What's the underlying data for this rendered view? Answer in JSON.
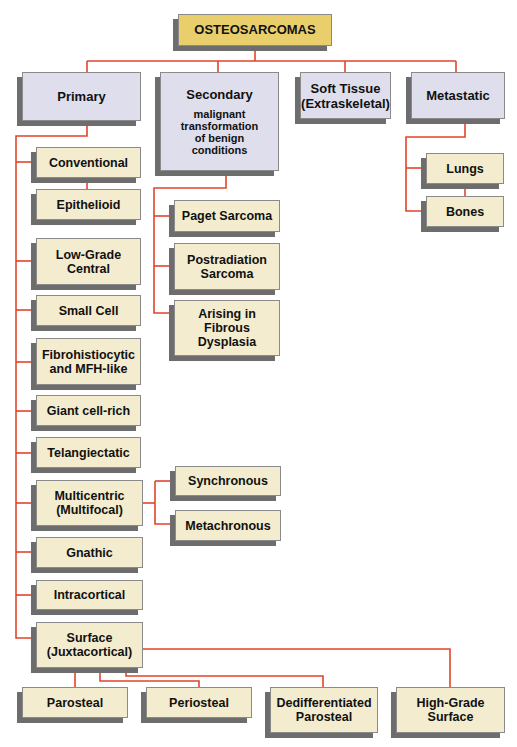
{
  "diagram": {
    "type": "tree",
    "colors": {
      "root_fill": "#e9cf6c",
      "category_fill": "#dedeec",
      "subtype_fill": "#f3ecce",
      "connector": "#e0452a",
      "shadow": "#6d6d6d"
    },
    "root": {
      "label": "OSTEOSARCOMAS"
    },
    "categories": {
      "primary": {
        "label": "Primary"
      },
      "secondary": {
        "label": "Secondary",
        "note": "malignant transformation of benign conditions"
      },
      "soft_tissue": {
        "label": "Soft Tissue (Extraskeletal)"
      },
      "metastatic": {
        "label": "Metastatic"
      }
    },
    "primary_subtypes": {
      "conventional": "Conventional",
      "epithelioid": "Epithelioid",
      "low_grade_central": "Low-Grade Central",
      "small_cell": "Small Cell",
      "fibrohistiocytic": "Fibrohistiocytic and MFH-like",
      "giant_cell_rich": "Giant cell-rich",
      "telangiectatic": "Telangiectatic",
      "multicentric": "Multicentric (Multifocal)",
      "gnathic": "Gnathic",
      "intracortical": "Intracortical",
      "surface": "Surface (Juxtacortical)"
    },
    "multicentric_subtypes": {
      "synchronous": "Synchronous",
      "metachronous": "Metachronous"
    },
    "surface_subtypes": {
      "parosteal": "Parosteal",
      "periosteal": "Periosteal",
      "dedifferentiated_parosteal": "Dedifferentiated Parosteal",
      "high_grade_surface": "High-Grade Surface"
    },
    "secondary_subtypes": {
      "paget_sarcoma": "Paget Sarcoma",
      "postradiation_sarcoma": "Postradiation Sarcoma",
      "arising_in_fibrous_dysplasia": "Arising in Fibrous Dysplasia"
    },
    "metastatic_subtypes": {
      "lungs": "Lungs",
      "bones": "Bones"
    },
    "edges": [
      [
        "root",
        "primary"
      ],
      [
        "root",
        "secondary"
      ],
      [
        "root",
        "soft_tissue"
      ],
      [
        "root",
        "metastatic"
      ],
      [
        "primary",
        "conventional"
      ],
      [
        "conventional",
        "epithelioid"
      ],
      [
        "primary",
        "low_grade_central"
      ],
      [
        "primary",
        "small_cell"
      ],
      [
        "primary",
        "fibrohistiocytic"
      ],
      [
        "primary",
        "giant_cell_rich"
      ],
      [
        "primary",
        "telangiectatic"
      ],
      [
        "primary",
        "multicentric"
      ],
      [
        "primary",
        "gnathic"
      ],
      [
        "primary",
        "intracortical"
      ],
      [
        "primary",
        "surface"
      ],
      [
        "multicentric",
        "synchronous"
      ],
      [
        "multicentric",
        "metachronous"
      ],
      [
        "surface",
        "parosteal"
      ],
      [
        "surface",
        "periosteal"
      ],
      [
        "surface",
        "dedifferentiated_parosteal"
      ],
      [
        "surface",
        "high_grade_surface"
      ],
      [
        "secondary",
        "paget_sarcoma"
      ],
      [
        "secondary",
        "postradiation_sarcoma"
      ],
      [
        "secondary",
        "arising_in_fibrous_dysplasia"
      ],
      [
        "metastatic",
        "lungs"
      ],
      [
        "lungs",
        "bones"
      ]
    ]
  }
}
